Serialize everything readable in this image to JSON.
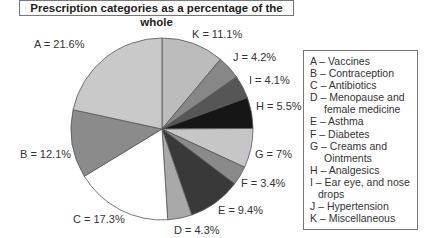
{
  "title": "Prescription categories as a percentage of the whole",
  "chart_data": {
    "type": "pie",
    "title": "Prescription categories as a percentage of the whole",
    "start_angle_deg": 0,
    "direction": "clockwise-from-top",
    "slices": [
      {
        "key": "K",
        "label": "K = 11.1%",
        "value": 11.1,
        "category": "Miscellaneous",
        "color": "#bcbcbc"
      },
      {
        "key": "J",
        "label": "J = 4.2%",
        "value": 4.2,
        "category": "Hypertension",
        "color": "#878787"
      },
      {
        "key": "I",
        "label": "I = 4.1%",
        "value": 4.1,
        "category": "Ear eye, and nose drops",
        "color": "#565656"
      },
      {
        "key": "H",
        "label": "H = 5.5%",
        "value": 5.5,
        "category": "Analgesics",
        "color": "#161616"
      },
      {
        "key": "G",
        "label": "G = 7%",
        "value": 7.0,
        "category": "Creams and Ointments",
        "color": "#c6c6c6"
      },
      {
        "key": "F",
        "label": "F = 3.4%",
        "value": 3.4,
        "category": "Diabetes",
        "color": "#8a8a8a"
      },
      {
        "key": "E",
        "label": "E = 9.4%",
        "value": 9.4,
        "category": "Asthma",
        "color": "#393939"
      },
      {
        "key": "D",
        "label": "D = 4.3%",
        "value": 4.3,
        "category": "Menopause and female medicine",
        "color": "#a9a9a9"
      },
      {
        "key": "C",
        "label": "C = 17.3%",
        "value": 17.3,
        "category": "Antibiotics",
        "color": "#ffffff"
      },
      {
        "key": "B",
        "label": "B = 12.1%",
        "value": 12.1,
        "category": "Contraception",
        "color": "#8b8b8b"
      },
      {
        "key": "A",
        "label": "A = 21.6%",
        "value": 21.6,
        "category": "Vaccines",
        "color": "#c9c9c9"
      }
    ],
    "legend_position": "right"
  },
  "labels": {
    "K": "K = 11.1%",
    "J": "J = 4.2%",
    "I": "I = 4.1%",
    "H": "H = 5.5%",
    "G": "G = 7%",
    "F": "F = 3.4%",
    "E": "E = 9.4%",
    "D": "D = 4.3%",
    "C": "C = 17.3%",
    "B": "B = 12.1%",
    "A": "A = 21.6%"
  },
  "legend": {
    "A": "A – Vaccines",
    "B": "B – Contraception",
    "C": "C – Antibiotics",
    "D1": "D – Menopause and",
    "D2": "female medicine",
    "E": "E – Asthma",
    "F": "F – Diabetes",
    "G1": "G – Creams and",
    "G2": "Ointments",
    "H": "H – Analgesics",
    "I1": "I – Ear eye, and nose",
    "I2": "drops",
    "J": "J – Hypertension",
    "K": "K – Miscellaneous"
  }
}
